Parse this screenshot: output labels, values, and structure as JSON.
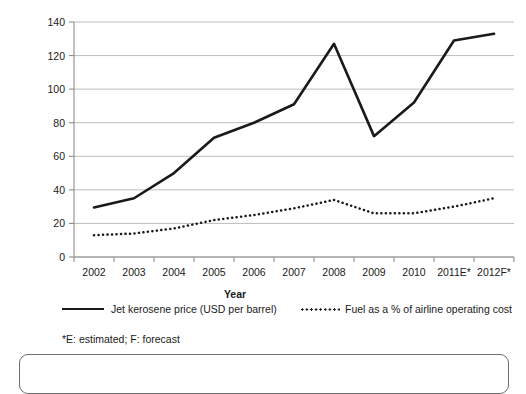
{
  "chart_data": {
    "type": "line",
    "title": "",
    "xlabel": "Year",
    "ylabel": "Price (USD) or proportion (%)",
    "categories": [
      "2002",
      "2003",
      "2004",
      "2005",
      "2006",
      "2007",
      "2008",
      "2009",
      "2010",
      "2011E*",
      "2012F*"
    ],
    "ylim": [
      0,
      140
    ],
    "yticks": [
      0,
      20,
      40,
      60,
      80,
      100,
      120,
      140
    ],
    "ytick_labels": [
      "0",
      "20",
      "40",
      "60",
      "80",
      "100",
      "120",
      "140"
    ],
    "grid": true,
    "grid_axis": "y",
    "legend_position": "bottom",
    "series": [
      {
        "name": "Jet kerosene price (USD per barrel)",
        "style": "solid",
        "color": "#1a1a1a",
        "values": [
          29.5,
          35,
          50,
          71,
          80,
          91,
          127,
          72,
          92,
          129,
          133
        ]
      },
      {
        "name": "Fuel as a % of airline operating cost",
        "style": "dotted",
        "color": "#1a1a1a",
        "values": [
          13,
          14,
          17,
          22,
          25,
          29,
          34,
          26,
          26,
          30,
          35
        ]
      }
    ],
    "annotations": [
      "*E: estimated; F: forecast"
    ]
  },
  "axis": {
    "x_title": "Year",
    "y_title": "Price (USD) or proportion (%)"
  },
  "legend": {
    "items": [
      {
        "label": "Jet kerosene price (USD per barrel)",
        "marker": "solid-line-swatch"
      },
      {
        "label": "Fuel as a % of airline operating cost",
        "marker": "dotted-line-swatch"
      }
    ]
  },
  "footnote": {
    "text": "*E: estimated; F: forecast"
  }
}
